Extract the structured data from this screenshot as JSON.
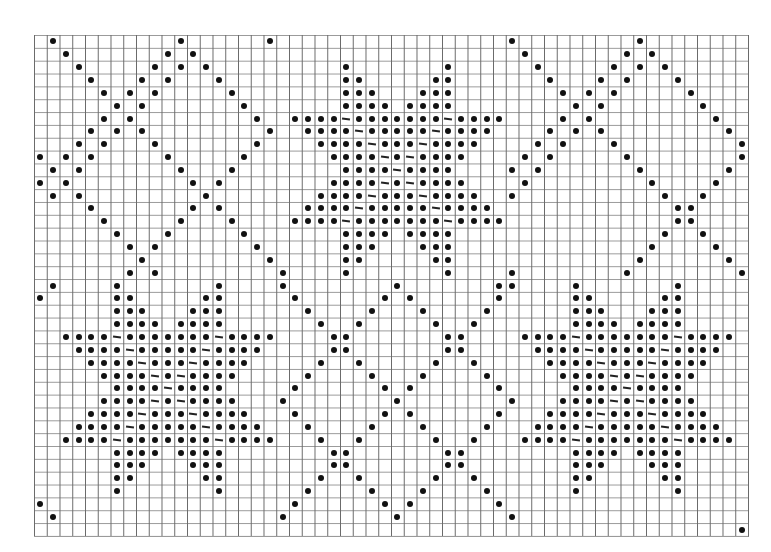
{
  "chart": {
    "type": "knitting-chart",
    "cols": 56,
    "rows": 39,
    "cell_w": 12.75,
    "cell_h": 12.85,
    "symbol_color": "#111111",
    "grid_color": "#6a6a6a"
  },
  "star_motif": {
    "width": 17,
    "height": 17,
    "mask": [
      "....o.......o....",
      "....oo.....oo....",
      "....ooo...ooo....",
      "....oooo.oooo....",
      "oooo-ooooooo-oooo",
      ".oooo-ooooo-oooo.",
      "..oooo-ooo-oooo..",
      "...oooo-o-oooo...",
      "....oooo-oooo....",
      "...oooo-o-oooo...",
      "..oooo-ooo-oooo..",
      ".oooo-ooooo-oooo.",
      "oooo-ooooooo-oooo",
      "....oooo.oooo....",
      "....ooo...ooo....",
      "....oo.....oo....",
      "....o.......o...."
    ]
  },
  "stars": [
    {
      "name": "star-top-center",
      "col": 20,
      "row": 2
    },
    {
      "name": "star-bottom-left",
      "col": 2,
      "row": 19
    },
    {
      "name": "star-bottom-right",
      "col": 38,
      "row": 19
    }
  ],
  "lattice_polylines": [
    [
      [
        1,
        0
      ],
      [
        19,
        18
      ]
    ],
    [
      [
        11,
        0
      ],
      [
        0,
        11
      ]
    ],
    [
      [
        12,
        1
      ],
      [
        1,
        12
      ]
    ],
    [
      [
        12,
        1
      ],
      [
        18,
        7
      ]
    ],
    [
      [
        18,
        7
      ],
      [
        7,
        18
      ]
    ],
    [
      [
        0,
        9
      ],
      [
        9,
        18
      ]
    ],
    [
      [
        0,
        20
      ],
      [
        1,
        19
      ]
    ],
    [
      [
        18,
        0
      ],
      [
        19,
        -1
      ]
    ],
    [
      [
        37,
        0
      ],
      [
        55,
        18
      ]
    ],
    [
      [
        47,
        0
      ],
      [
        37,
        10
      ]
    ],
    [
      [
        48,
        1
      ],
      [
        37,
        12
      ]
    ],
    [
      [
        48,
        1
      ],
      [
        55,
        8
      ]
    ],
    [
      [
        55,
        9
      ],
      [
        46,
        18
      ]
    ],
    [
      [
        36,
        19
      ],
      [
        37,
        18
      ]
    ],
    [
      [
        19,
        19
      ],
      [
        37,
        37
      ]
    ],
    [
      [
        28,
        19
      ],
      [
        19,
        28
      ]
    ],
    [
      [
        28,
        19
      ],
      [
        37,
        28
      ]
    ],
    [
      [
        37,
        28
      ],
      [
        28,
        37
      ]
    ],
    [
      [
        19,
        28
      ],
      [
        28,
        37
      ]
    ],
    [
      [
        28,
        37
      ],
      [
        28,
        37
      ]
    ],
    [
      [
        37,
        19
      ],
      [
        19,
        37
      ]
    ],
    [
      [
        0,
        36
      ],
      [
        1,
        37
      ]
    ],
    [
      [
        55,
        38
      ],
      [
        55,
        38
      ]
    ]
  ]
}
